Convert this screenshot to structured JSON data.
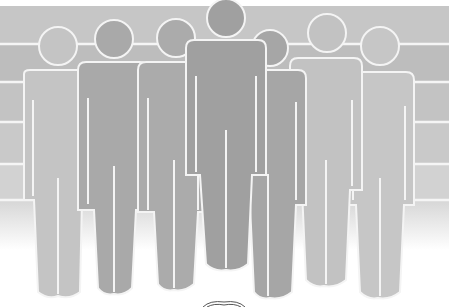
{
  "image": {
    "description": "Illustration of seven human silhouettes standing side by side in a row in varying shades of grey, in front of a banded grey wall with white horizontal lines",
    "figure_count": 7,
    "colors": {
      "background": "#ffffff",
      "wall_top": "#c4c4c4",
      "wall_band_dark": "#b9b9b9",
      "wall_band_light": "#d0d0d0",
      "wall_fade": "#e6e6e6",
      "line": "#f4f4f4",
      "figure_light": "#c2c2c2",
      "figure_mid": "#a8a8a8",
      "figure_dark": "#9c9c9c",
      "figure_center": "#a0a0a0"
    },
    "figures": [
      {
        "id": "figure-1",
        "shade": "light",
        "head_x": 58,
        "head_y": 45,
        "head_r": 19
      },
      {
        "id": "figure-2",
        "shade": "mid",
        "head_x": 114,
        "head_y": 38,
        "head_r": 19
      },
      {
        "id": "figure-3",
        "shade": "mid",
        "head_x": 176,
        "head_y": 38,
        "head_r": 19
      },
      {
        "id": "figure-4",
        "shade": "dark",
        "head_x": 226,
        "head_y": 18,
        "head_r": 19
      },
      {
        "id": "figure-5",
        "shade": "mid",
        "head_x": 270,
        "head_y": 47,
        "head_r": 18
      },
      {
        "id": "figure-6",
        "shade": "light",
        "head_x": 327,
        "head_y": 33,
        "head_r": 19
      },
      {
        "id": "figure-7",
        "shade": "light",
        "head_x": 380,
        "head_y": 45,
        "head_r": 19
      }
    ]
  }
}
